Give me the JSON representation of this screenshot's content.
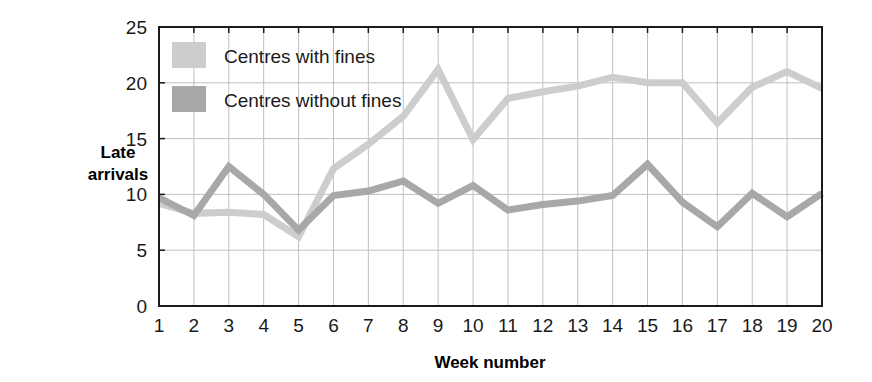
{
  "chart_data": {
    "type": "line",
    "title": "",
    "xlabel": "Week number",
    "ylabel": "Late arrivals",
    "xlim": [
      1,
      20
    ],
    "ylim": [
      0,
      25
    ],
    "ytick_values": [
      0,
      5,
      10,
      15,
      20,
      25
    ],
    "ytick_labels": [
      "0",
      "5",
      "10",
      "15",
      "20",
      "25"
    ],
    "x": [
      1,
      2,
      3,
      4,
      5,
      6,
      7,
      8,
      9,
      10,
      11,
      12,
      13,
      14,
      15,
      16,
      17,
      18,
      19,
      20
    ],
    "xtick_labels": [
      "1",
      "2",
      "3",
      "4",
      "5",
      "6",
      "7",
      "8",
      "9",
      "10",
      "11",
      "12",
      "13",
      "14",
      "15",
      "16",
      "17",
      "18",
      "19",
      "20"
    ],
    "grid": true,
    "grid_color": "#bfbfbf",
    "axis_color": "#1a1a1a",
    "legend_position": "top-left",
    "series": [
      {
        "name": "Centres with fines",
        "color": "#cdcdcd",
        "values": [
          9.2,
          8.3,
          8.4,
          8.2,
          6.2,
          12.3,
          14.5,
          17.0,
          21.2,
          14.9,
          18.6,
          19.2,
          19.7,
          20.5,
          20.0,
          20.0,
          16.4,
          19.6,
          21.0,
          19.5
        ]
      },
      {
        "name": "Centres without fines",
        "color": "#a8a8a8",
        "values": [
          9.7,
          8.1,
          12.5,
          10.0,
          6.8,
          9.9,
          10.3,
          11.2,
          9.2,
          10.8,
          8.6,
          9.1,
          9.4,
          9.9,
          12.7,
          9.3,
          7.1,
          10.1,
          8.0,
          10.1
        ]
      }
    ]
  },
  "legend": {
    "items": [
      {
        "label": "Centres with fines",
        "color": "#cdcdcd"
      },
      {
        "label": "Centres without fines",
        "color": "#a8a8a8"
      }
    ]
  },
  "axes": {
    "y_label_line1": "Late",
    "y_label_line2": "arrivals",
    "x_label": "Week number"
  }
}
